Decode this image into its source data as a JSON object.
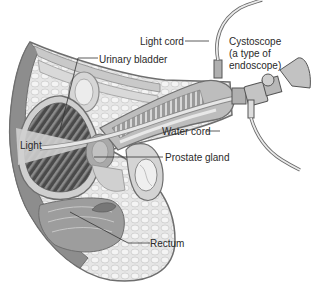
{
  "diagram": {
    "labels": {
      "light_cord": "Light cord",
      "urinary_bladder": "Urinary bladder",
      "cystoscope_line1": "Cystoscope",
      "cystoscope_line2": "(a type of",
      "cystoscope_line3": "endoscope)",
      "light": "Light",
      "water_cord": "Water cord",
      "prostate_gland": "Prostate gland",
      "rectum": "Rectum"
    },
    "colors": {
      "background": "#ffffff",
      "tissue_light": "#e4e4e4",
      "tissue_mid": "#bdbdbd",
      "tissue_dark": "#5a5a5a",
      "bladder_interior": "#3d3d3d",
      "outline": "#6e6e6e",
      "leader_line": "#333333",
      "text": "#2a2a2a"
    }
  }
}
